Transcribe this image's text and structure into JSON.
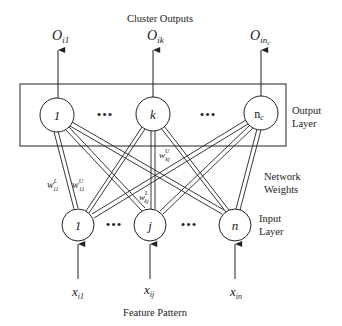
{
  "title": "Cluster Outputs",
  "caption": "Feature Pattern",
  "colors": {
    "stroke": "#222222",
    "background": "#ffffff"
  },
  "output_layer": {
    "label_line1": "Output",
    "label_line2": "Layer",
    "nodes": [
      {
        "label": "1",
        "output_main": "O",
        "output_sub": "i1"
      },
      {
        "label": "k",
        "output_main": "O",
        "output_sub": "ik"
      },
      {
        "label": "n",
        "label_sub": "c",
        "output_main": "O",
        "output_sub": "in",
        "output_subsub": "c"
      }
    ]
  },
  "input_layer": {
    "label_line1": "Input",
    "label_line2": "Layer",
    "nodes": [
      {
        "label": "1",
        "input_main": "x",
        "input_sub": "i1"
      },
      {
        "label": "j",
        "input_main": "x",
        "input_sub": "ij"
      },
      {
        "label": "n",
        "input_main": "x",
        "input_sub": "in"
      }
    ]
  },
  "weights": {
    "label_line1": "Network",
    "label_line2": "Weights",
    "w11L": {
      "main": "w",
      "sup": "L",
      "sub": "11"
    },
    "w11U": {
      "main": "w",
      "sup": "U",
      "sub": "11"
    },
    "wkjU": {
      "main": "w",
      "sup": "U",
      "sub": "kj"
    },
    "wkjL": {
      "main": "w",
      "sup": "L",
      "sub": "kj"
    }
  },
  "ellipsis": "•••"
}
